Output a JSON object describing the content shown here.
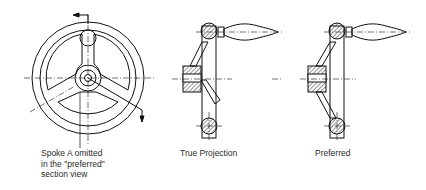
{
  "figure": {
    "views": [
      {
        "id": "front-view",
        "caption": "Spoke A omitted\nin the \"preferred\"\nsection view"
      },
      {
        "id": "true-projection",
        "caption": "True Projection"
      },
      {
        "id": "preferred",
        "caption": "Preferred"
      }
    ],
    "colors": {
      "line": "#111111",
      "background": "#ffffff",
      "text": "#2a2a2a"
    }
  }
}
